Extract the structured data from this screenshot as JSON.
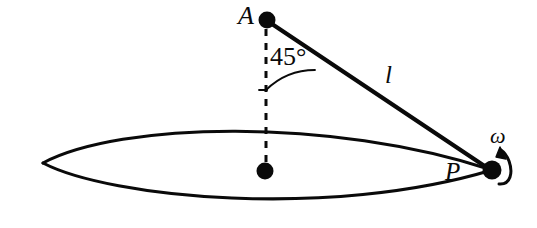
{
  "figure": {
    "background_color": "#ffffff",
    "stroke_color": "#0a0a0a",
    "labels": {
      "point_a": "A",
      "point_p": "P",
      "rod_length": "l",
      "angular_velocity": "ω",
      "angle": "45°"
    },
    "geometry": {
      "point_a": {
        "x": 267,
        "y": 20,
        "radius": 8.5
      },
      "point_center": {
        "x": 265,
        "y": 171,
        "radius": 8.5
      },
      "point_p": {
        "x": 492,
        "y": 170,
        "radius": 9.5
      },
      "circle_lens": {
        "left_tip_x": 43,
        "left_tip_y": 163,
        "right_tip_x": 492,
        "right_tip_y": 170,
        "top_y": 128,
        "bottom_y": 210
      },
      "dashed_line": {
        "x": 266,
        "y1": 28,
        "y2": 163
      },
      "angle_arc_radius": 70,
      "angle_value_degrees": 45
    }
  }
}
